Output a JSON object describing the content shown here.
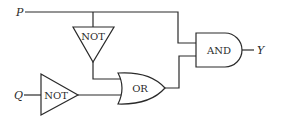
{
  "diagram": {
    "type": "logic-circuit",
    "inputs": [
      {
        "id": "P",
        "label": "P"
      },
      {
        "id": "Q",
        "label": "Q"
      }
    ],
    "output": {
      "id": "Y",
      "label": "Y"
    },
    "gates": [
      {
        "id": "not1",
        "label": "NOT",
        "input": "P"
      },
      {
        "id": "not2",
        "label": "NOT",
        "input": "Q"
      },
      {
        "id": "or1",
        "label": "OR",
        "inputs": [
          "not1",
          "not2"
        ]
      },
      {
        "id": "and1",
        "label": "AND",
        "inputs": [
          "P",
          "or1"
        ]
      }
    ]
  }
}
